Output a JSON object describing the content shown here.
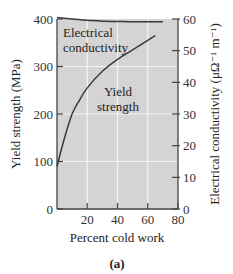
{
  "chart_data": {
    "type": "line",
    "title": "",
    "caption": "(a)",
    "xlabel": "Percent cold work",
    "ylabel": "Yield strength (MPa)",
    "ylabel_right": "Electrical conductivity (μΩ⁻¹ m⁻¹)",
    "xlim": [
      0,
      80
    ],
    "ylim": [
      0,
      400
    ],
    "ylim_right": [
      0,
      60
    ],
    "x_ticks": [
      "20",
      "40",
      "60",
      "80"
    ],
    "y_ticks": [
      "0",
      "100",
      "200",
      "300",
      "400"
    ],
    "y_ticks_right": [
      "0",
      "10",
      "20",
      "30",
      "40",
      "50",
      "60"
    ],
    "grid": true,
    "background": "#d4d4d4",
    "series": [
      {
        "name": "Electrical conductivity",
        "axis": "right",
        "annotation": [
          "Electrical",
          "conductivity"
        ],
        "x": [
          0,
          10,
          20,
          30,
          40,
          50,
          60,
          70
        ],
        "values": [
          60.5,
          60.0,
          59.6,
          59.3,
          59.2,
          59.1,
          59.1,
          59.1
        ]
      },
      {
        "name": "Yield strength",
        "axis": "left",
        "annotation": [
          "Yield",
          "strength"
        ],
        "x": [
          0,
          5,
          10,
          15,
          20,
          30,
          40,
          50,
          60,
          65
        ],
        "values": [
          90,
          150,
          200,
          230,
          255,
          290,
          315,
          335,
          355,
          365
        ]
      }
    ]
  }
}
